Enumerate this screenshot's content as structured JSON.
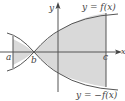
{
  "figure": {
    "type": "region between curves",
    "curve_top_label": "y = f(x)",
    "curve_bottom_label": "y = −f(x)",
    "axis_x_label": "x",
    "axis_y_label": "y",
    "point_a": "a",
    "point_b": "b",
    "point_c": "c",
    "colors": {
      "region_fill": "#d9d9d9",
      "curve": "#555555",
      "axis": "#555555",
      "text": "#444444"
    }
  }
}
